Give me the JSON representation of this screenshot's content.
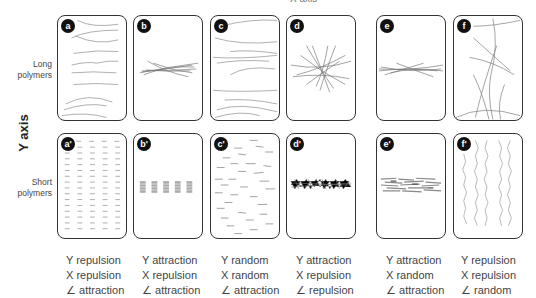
{
  "top_axis_label": "X axis",
  "y_axis_label": "Y axis",
  "rows": [
    {
      "label_line1": "Long",
      "label_line2": "polymers"
    },
    {
      "label_line1": "Short",
      "label_line2": "polymers"
    }
  ],
  "panels": {
    "top": [
      {
        "id": "a",
        "badge": "a"
      },
      {
        "id": "b",
        "badge": "b"
      },
      {
        "id": "c",
        "badge": "c"
      },
      {
        "id": "d",
        "badge": "d"
      },
      {
        "id": "e",
        "badge": "e"
      },
      {
        "id": "f",
        "badge": "f"
      }
    ],
    "bottom": [
      {
        "id": "a'",
        "badge": "a'"
      },
      {
        "id": "b'",
        "badge": "b'"
      },
      {
        "id": "c'",
        "badge": "c'"
      },
      {
        "id": "d'",
        "badge": "d'"
      },
      {
        "id": "e'",
        "badge": "e'"
      },
      {
        "id": "f'",
        "badge": "f'"
      }
    ]
  },
  "captions": [
    {
      "y": "Y repulsion",
      "x": "X repulsion",
      "angle": "∠ attraction"
    },
    {
      "y": "Y attraction",
      "x": "X repulsion",
      "angle": "∠ attraction"
    },
    {
      "y": "Y random",
      "x": "X random",
      "angle": "∠ attraction"
    },
    {
      "y": "Y attraction",
      "x": "X repulsion",
      "angle": "∠ repulsion"
    },
    {
      "y": "Y attraction",
      "x": "X random",
      "angle": "∠ attraction"
    },
    {
      "y": "Y repulsion",
      "x": "X repulsion",
      "angle": "∠ random"
    }
  ],
  "colors": {
    "border": "#333333",
    "badge": "#111111",
    "strand": "#888888",
    "text": "#444444"
  }
}
